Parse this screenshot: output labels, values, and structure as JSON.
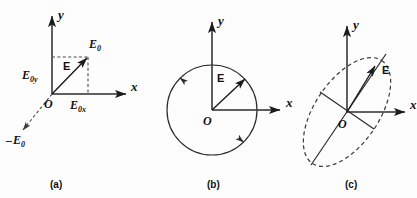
{
  "figure": {
    "background_color": "#fdfdfd",
    "ink_color": "#1b1b1b",
    "panels": [
      {
        "id": "a",
        "caption": "(a)",
        "description": "linear polarization",
        "axes": {
          "x_label": "x",
          "y_label": "y",
          "origin_label": "O"
        },
        "labels": {
          "field_vector": "E",
          "amplitude": "E",
          "amplitude_sub": "0",
          "component_y": "E",
          "component_y_sub": "0y",
          "component_x": "E",
          "component_x_sub": "0x",
          "negative_amplitude_sign": "–",
          "negative_amplitude": "E",
          "negative_amplitude_sub": "0"
        }
      },
      {
        "id": "b",
        "caption": "(b)",
        "description": "circular polarization",
        "axes": {
          "x_label": "x",
          "y_label": "y",
          "origin_label": "O"
        },
        "labels": {
          "field_vector": "E"
        },
        "rotation_sense": "counterclockwise"
      },
      {
        "id": "c",
        "caption": "(c)",
        "description": "elliptical polarization",
        "axes": {
          "x_label": "x",
          "y_label": "y",
          "origin_label": "O"
        },
        "labels": {
          "field_vector": "E"
        },
        "ellipse_tilt_degrees": -56
      }
    ]
  }
}
